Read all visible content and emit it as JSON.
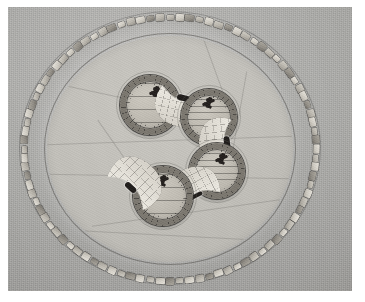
{
  "scene": {
    "kind": "photograph",
    "subject": "archaeological-site-model-circular-enclosure",
    "caption": "",
    "palette": {
      "page": "#ffffff",
      "photo_border": "#4a4a4a",
      "ground": "#ababa8",
      "plaza": "#c2c0ba",
      "stone_light": "#e8e5dd",
      "stone_mid": "#bab6ad",
      "stone_dark": "#736f68",
      "hut_rim": "#7b776f",
      "hut_fill": "#bdb9b0",
      "crescent_fill": "#eae7df",
      "figure": "#231f1d"
    }
  },
  "plate": {
    "label": "photo-plate",
    "left": 8,
    "top": 7,
    "width": 344,
    "height": 284
  },
  "monument": {
    "label": "circular-enclosure",
    "outer_wall": {
      "label": "outer-stone-ring",
      "stone_count": 92,
      "note": "ring of individual rectangular blocks"
    },
    "inner_boundary": {
      "label": "inner-scribed-circle"
    },
    "plaza": {
      "label": "central-plaza",
      "surface": "flat-light-grey"
    },
    "structures": [
      {
        "id": 1,
        "type": "round-hut",
        "angle_deg": 248,
        "radius_pct": 36,
        "size": 60,
        "has_figure": true,
        "figure": "cross-marker"
      },
      {
        "id": 2,
        "type": "crescent",
        "angle_deg": 283,
        "radius_pct": 38,
        "size": 54,
        "has_figure": true,
        "figure": "dark-oval"
      },
      {
        "id": 3,
        "type": "round-hut",
        "angle_deg": 318,
        "radius_pct": 36,
        "size": 56,
        "has_figure": true,
        "figure": "cross-marker"
      },
      {
        "id": 4,
        "type": "crescent",
        "angle_deg": 353,
        "radius_pct": 38,
        "size": 52,
        "has_figure": true,
        "figure": "dark-oval"
      },
      {
        "id": 5,
        "type": "round-hut",
        "angle_deg": 28,
        "radius_pct": 36,
        "size": 56,
        "has_figure": true,
        "figure": "cross-marker"
      },
      {
        "id": 6,
        "type": "crescent",
        "angle_deg": 63,
        "radius_pct": 38,
        "size": 54,
        "has_figure": true,
        "figure": "dark-oval"
      },
      {
        "id": 7,
        "type": "round-hut",
        "angle_deg": 98,
        "radius_pct": 36,
        "size": 60,
        "has_figure": true,
        "figure": "cross-marker"
      },
      {
        "id": 8,
        "type": "crescent",
        "angle_deg": 133,
        "radius_pct": 38,
        "size": 56,
        "has_figure": true,
        "figure": "dark-oval"
      }
    ],
    "counts": {
      "round_huts": 4,
      "crescents": 4,
      "total_structures": 8
    }
  }
}
